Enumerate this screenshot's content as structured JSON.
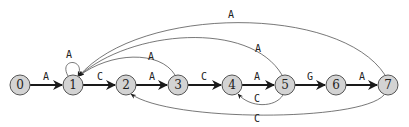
{
  "diagram": {
    "type": "automaton",
    "nodes": [
      {
        "id": "0",
        "label": "0",
        "x": 20,
        "y": 85
      },
      {
        "id": "1",
        "label": "1",
        "x": 73,
        "y": 85
      },
      {
        "id": "2",
        "label": "2",
        "x": 126,
        "y": 85
      },
      {
        "id": "3",
        "label": "3",
        "x": 178,
        "y": 85
      },
      {
        "id": "4",
        "label": "4",
        "x": 232,
        "y": 85
      },
      {
        "id": "5",
        "label": "5",
        "x": 285,
        "y": 85
      },
      {
        "id": "6",
        "label": "6",
        "x": 336,
        "y": 85
      },
      {
        "id": "7",
        "label": "7",
        "x": 388,
        "y": 85
      }
    ],
    "edges": [
      {
        "from": "0",
        "to": "1",
        "label": "A",
        "style": "main"
      },
      {
        "from": "1",
        "to": "2",
        "label": "C",
        "style": "main"
      },
      {
        "from": "2",
        "to": "3",
        "label": "A",
        "style": "main"
      },
      {
        "from": "3",
        "to": "4",
        "label": "C",
        "style": "main"
      },
      {
        "from": "4",
        "to": "5",
        "label": "A",
        "style": "main"
      },
      {
        "from": "5",
        "to": "6",
        "label": "G",
        "style": "main"
      },
      {
        "from": "6",
        "to": "7",
        "label": "A",
        "style": "main"
      },
      {
        "from": "1",
        "to": "1",
        "label": "A",
        "style": "self-loop"
      },
      {
        "from": "3",
        "to": "1",
        "label": "A",
        "style": "back-arc-top"
      },
      {
        "from": "5",
        "to": "1",
        "label": "A",
        "style": "back-arc-top"
      },
      {
        "from": "7",
        "to": "1",
        "label": "A",
        "style": "back-arc-top"
      },
      {
        "from": "5",
        "to": "4",
        "label": "C",
        "style": "back-arc-bottom"
      },
      {
        "from": "7",
        "to": "2",
        "label": "C",
        "style": "back-arc-bottom"
      }
    ]
  }
}
